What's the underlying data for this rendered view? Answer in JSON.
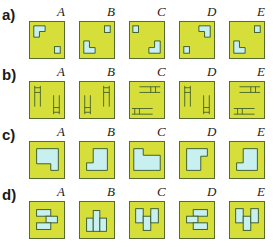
{
  "figure": {
    "fill_color": "#d6df3a",
    "shape_color": "#c8f0f0",
    "line_color": "#3a5a2a",
    "rows": [
      {
        "label": "a)",
        "options": [
          "A",
          "B",
          "C",
          "D",
          "E"
        ],
        "kind": "L-shape and small square positions"
      },
      {
        "label": "b)",
        "options": [
          "A",
          "B",
          "C",
          "D",
          "E"
        ],
        "kind": "line-figure orientations"
      },
      {
        "label": "c)",
        "options": [
          "A",
          "B",
          "C",
          "D",
          "E"
        ],
        "kind": "notched polygon rotations"
      },
      {
        "label": "d)",
        "options": [
          "A",
          "B",
          "C",
          "D",
          "E"
        ],
        "kind": "composite block arrangements"
      }
    ]
  }
}
